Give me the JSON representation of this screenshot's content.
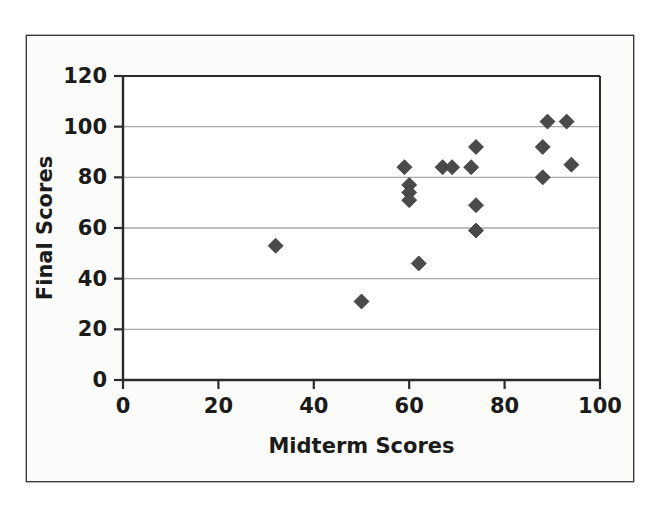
{
  "chart_data": {
    "type": "scatter",
    "title": "",
    "xlabel": "Midterm Scores",
    "ylabel": "Final Scores",
    "xlim": [
      0,
      100
    ],
    "ylim": [
      0,
      120
    ],
    "xticks": [
      0,
      20,
      40,
      60,
      80,
      100
    ],
    "yticks": [
      0,
      20,
      40,
      60,
      80,
      100,
      120
    ],
    "grid": "horizontal",
    "legend": "none",
    "marker": "diamond",
    "marker_color": "#4a4a4a",
    "points": [
      {
        "x": 32,
        "y": 53
      },
      {
        "x": 50,
        "y": 31
      },
      {
        "x": 59,
        "y": 84
      },
      {
        "x": 60,
        "y": 77
      },
      {
        "x": 60,
        "y": 74
      },
      {
        "x": 60,
        "y": 71
      },
      {
        "x": 62,
        "y": 46
      },
      {
        "x": 67,
        "y": 84
      },
      {
        "x": 69,
        "y": 84
      },
      {
        "x": 73,
        "y": 84
      },
      {
        "x": 74,
        "y": 92
      },
      {
        "x": 74,
        "y": 69
      },
      {
        "x": 74,
        "y": 59
      },
      {
        "x": 88,
        "y": 92
      },
      {
        "x": 88,
        "y": 80
      },
      {
        "x": 89,
        "y": 102
      },
      {
        "x": 93,
        "y": 102
      },
      {
        "x": 94,
        "y": 85
      }
    ]
  },
  "axes": {
    "x_tick_labels": [
      "0",
      "20",
      "40",
      "60",
      "80",
      "100"
    ],
    "y_tick_labels": [
      "0",
      "20",
      "40",
      "60",
      "80",
      "100",
      "120"
    ],
    "x_title": "Midterm Scores",
    "y_title": "Final Scores"
  },
  "style": {
    "frame_border": "#3a3a3a",
    "axis_line": "#2b2b2b",
    "gridline": "#a9a9a9",
    "marker_fill": "#4a4a4a",
    "plot_background": "#ffffff",
    "figure_background": "#fbfbfa"
  }
}
